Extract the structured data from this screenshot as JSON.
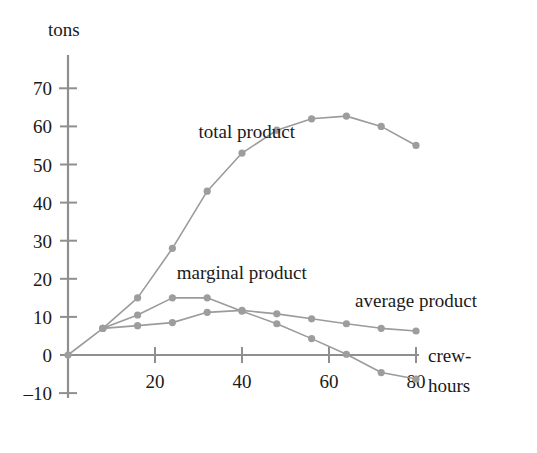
{
  "chart_data": {
    "type": "line",
    "title": "",
    "xlabel": "crew-hours",
    "ylabel": "tons",
    "xlim": [
      0,
      84
    ],
    "ylim": [
      -10,
      70
    ],
    "xticks": [
      20,
      40,
      60,
      80
    ],
    "yticks": [
      -10,
      0,
      10,
      20,
      30,
      40,
      50,
      60,
      70
    ],
    "grid": false,
    "legend": "inline-annotations",
    "series": [
      {
        "name": "total product",
        "label_x": 30,
        "label_y": 57,
        "x": [
          0,
          8,
          16,
          24,
          32,
          40,
          48,
          56,
          64,
          72,
          80
        ],
        "y": [
          0,
          7,
          15,
          28,
          43,
          53,
          59,
          62,
          62.7,
          60,
          55
        ]
      },
      {
        "name": "marginal product",
        "label_x": 25,
        "label_y": 20,
        "x": [
          8,
          16,
          24,
          32,
          40,
          48,
          56,
          64,
          72,
          80
        ],
        "y": [
          7,
          10.5,
          15,
          15,
          11.5,
          8.2,
          4.3,
          0.2,
          -4.6,
          -6.3
        ]
      },
      {
        "name": "average product",
        "label_x": 66,
        "label_y": 12.5,
        "x": [
          8,
          16,
          24,
          32,
          40,
          48,
          56,
          64,
          72,
          80
        ],
        "y": [
          7,
          7.7,
          8.5,
          11.2,
          11.7,
          10.8,
          9.5,
          8.2,
          7.0,
          6.3
        ]
      }
    ]
  },
  "axes": {
    "y_axis_title": "tons",
    "x_axis_title_line1": "crew-",
    "x_axis_title_line2": "hours",
    "y_tick_labels": [
      "70",
      "60",
      "50",
      "40",
      "30",
      "20",
      "10",
      "0",
      "–10"
    ],
    "x_tick_labels": [
      "20",
      "40",
      "60",
      "80"
    ]
  },
  "labels": {
    "total_product": "total product",
    "marginal_product": "marginal product",
    "average_product": "average product"
  },
  "colors": {
    "series_stroke": "#9b9b9b",
    "series_marker": "#9d9d9d",
    "axis": "#8f8f8f",
    "text": "#1a1a1a",
    "background": "#ffffff"
  }
}
